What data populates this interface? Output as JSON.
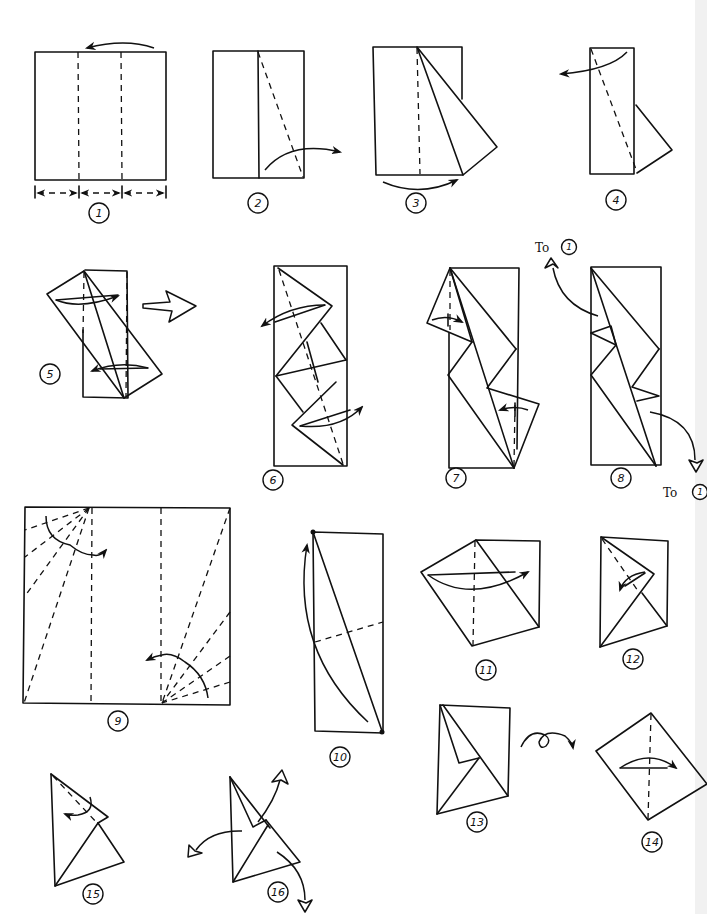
{
  "page": {
    "background": "#ffffff",
    "ink_color": "#111111"
  },
  "steps": [
    {
      "number": "1",
      "label": "1",
      "description": "Square divided into thirds with valley folds; fold right third over to the left",
      "equal_marks": "= = ="
    },
    {
      "number": "2",
      "label": "2",
      "description": "Fold diagonal valley on the right panel, bring corner outward to the right"
    },
    {
      "number": "3",
      "label": "3",
      "description": "Result with flap swung out; fold along centre"
    },
    {
      "number": "4",
      "label": "4",
      "description": "Fold diagonal and turn flap to the left"
    },
    {
      "number": "5",
      "label": "5",
      "description": "Reverse-fold top and bottom corners"
    },
    {
      "number": "6",
      "label": "6",
      "description": "Diamond folds; open top and bottom points outward"
    },
    {
      "number": "7",
      "label": "7",
      "description": "Fold flaps along dashed lines"
    },
    {
      "number": "8",
      "label": "8",
      "description": "Result; repeat sequence",
      "ref_top": {
        "prefix": "To",
        "target": "1"
      },
      "ref_bottom": {
        "prefix": "To",
        "target": "1"
      }
    },
    {
      "number": "9",
      "label": "9",
      "description": "Square with radial crease fans at two corners and two vertical valley folds"
    },
    {
      "number": "10",
      "label": "10",
      "description": "Fold bottom-right corner dot to top-left dot"
    },
    {
      "number": "11",
      "label": "11",
      "description": "Fold left flap over to the right"
    },
    {
      "number": "12",
      "label": "12",
      "description": "Fold top flap down along dashed line"
    },
    {
      "number": "13",
      "label": "13",
      "description": "Turn the model over"
    },
    {
      "number": "14",
      "label": "14",
      "description": "Fold in half along dashed line"
    },
    {
      "number": "15",
      "label": "15",
      "description": "Fold corner along dashed line"
    },
    {
      "number": "16",
      "label": "16",
      "description": "Pull the three points outward"
    }
  ],
  "turn_over_symbol": "turn-over-loop-arrow",
  "result_arrow_symbol": "hollow-result-arrow"
}
